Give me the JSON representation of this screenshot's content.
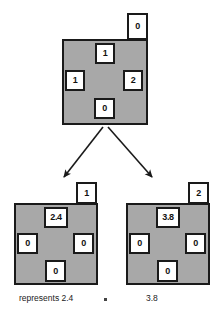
{
  "diagram": {
    "fill_color": "#a8a8a8",
    "stroke_color": "#1a1a1a",
    "background": "#ffffff"
  },
  "machines": {
    "source": {
      "name": "source-machine",
      "tab_value": "0",
      "top_value": "1",
      "left_value": "1",
      "right_value": "2",
      "bottom_value": "0"
    },
    "left_result": {
      "name": "left-result-machine",
      "tab_value": "1",
      "top_value": "2.4",
      "left_value": "0",
      "right_value": "0",
      "bottom_value": "0"
    },
    "right_result": {
      "name": "right-result-machine",
      "tab_value": "2",
      "top_value": "3.8",
      "left_value": "0",
      "right_value": "0",
      "bottom_value": "0"
    }
  },
  "captions": {
    "left_label": "represents 2.4",
    "separator": "",
    "right_label": "3.8"
  }
}
